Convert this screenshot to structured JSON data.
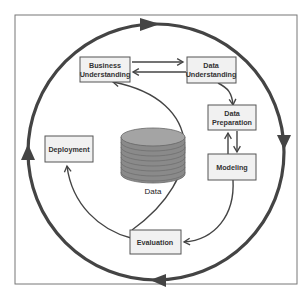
{
  "diagram": {
    "center": {
      "label": "Data",
      "icon": "database-cylinder-icon"
    },
    "phases": [
      {
        "id": "business-understanding",
        "line1": "Business",
        "line2": "Understanding"
      },
      {
        "id": "data-understanding",
        "line1": "Data",
        "line2": "Understanding"
      },
      {
        "id": "data-preparation",
        "line1": "Data",
        "line2": "Preparation"
      },
      {
        "id": "modeling",
        "line1": "Modeling"
      },
      {
        "id": "evaluation",
        "line1": "Evaluation"
      },
      {
        "id": "deployment",
        "line1": "Deployment"
      }
    ],
    "flows": [
      {
        "from": "Business Understanding",
        "to": "Data Understanding"
      },
      {
        "from": "Data Understanding",
        "to": "Business Understanding"
      },
      {
        "from": "Data Understanding",
        "to": "Data Preparation"
      },
      {
        "from": "Data Preparation",
        "to": "Modeling"
      },
      {
        "from": "Modeling",
        "to": "Data Preparation"
      },
      {
        "from": "Modeling",
        "to": "Evaluation"
      },
      {
        "from": "Evaluation",
        "to": "Business Understanding"
      },
      {
        "from": "Evaluation",
        "to": "Deployment"
      }
    ],
    "outer_cycle": "clockwise",
    "colors": {
      "line": "#444444",
      "box_fill": "#f1f1f1",
      "box_stroke": "#555555",
      "cylinder": "#8a8a8a"
    }
  }
}
